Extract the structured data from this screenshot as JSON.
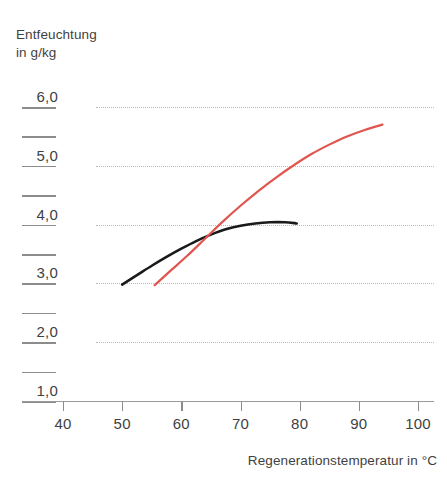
{
  "chart_data": {
    "type": "line",
    "title": "Entfeuchtung in g/kg",
    "ylabel": "Entfeuchtung\nin g/kg",
    "xlabel": "Regenerationstemperatur in °C",
    "xlim": [
      35,
      102
    ],
    "ylim": [
      0.7,
      6.3
    ],
    "xticks": [
      40,
      50,
      60,
      70,
      80,
      90,
      100
    ],
    "xtick_labels": [
      "40",
      "50",
      "60",
      "70",
      "80",
      "90",
      "100"
    ],
    "yticks": [
      1.0,
      2.0,
      3.0,
      4.0,
      5.0,
      6.0
    ],
    "ytick_labels": [
      "1,0",
      "2,0",
      "3,0",
      "4,0",
      "5,0",
      "6,0"
    ],
    "yminor_ticks": [
      1.5,
      2.5,
      3.5,
      4.5,
      5.5
    ],
    "grid": "horizontal-dotted",
    "gridline_values": [
      2.0,
      3.0,
      4.0,
      5.0,
      6.0
    ],
    "legend": "none",
    "series": [
      {
        "name": "curve-black",
        "color": "#1a1a1a",
        "x": [
          50.0,
          52.5,
          55.0,
          57.5,
          60.0,
          62.5,
          65.0,
          67.5,
          70.0,
          72.5,
          75.0,
          77.5,
          79.5
        ],
        "y": [
          2.98,
          3.14,
          3.3,
          3.45,
          3.59,
          3.72,
          3.83,
          3.92,
          3.98,
          4.02,
          4.04,
          4.04,
          4.02
        ]
      },
      {
        "name": "curve-red",
        "color": "#e0554e",
        "x": [
          55.5,
          58.0,
          61.0,
          64.0,
          67.0,
          70.0,
          73.0,
          76.0,
          79.0,
          82.0,
          85.0,
          88.0,
          91.0,
          94.0
        ],
        "y": [
          2.97,
          3.2,
          3.47,
          3.76,
          4.05,
          4.32,
          4.57,
          4.8,
          5.01,
          5.2,
          5.36,
          5.5,
          5.61,
          5.7
        ]
      }
    ],
    "annotations": {
      "intersection_x": 64.0,
      "intersection_y": 3.79
    }
  },
  "axis": {
    "y_title": "Entfeuchtung\nin g/kg",
    "x_title": "Regenerationstemperatur in °C"
  },
  "colors": {
    "series_black": "#1a1a1a",
    "series_red": "#e0554e",
    "gridline": "#b9b9c4",
    "axis": "#9a9a9a",
    "text": "#3f3f3f"
  }
}
